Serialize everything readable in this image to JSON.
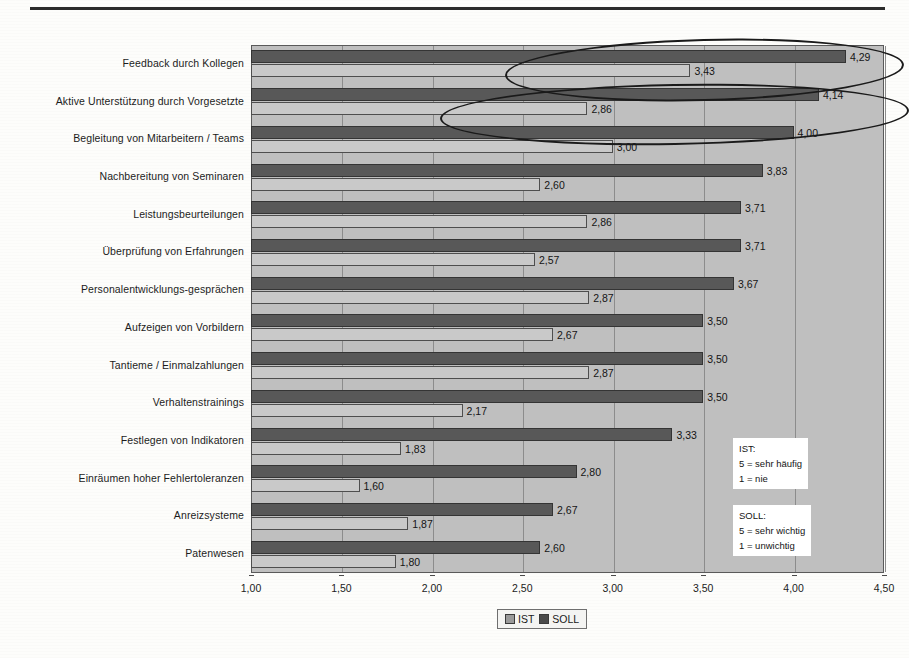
{
  "chart_data": {
    "type": "bar",
    "orientation": "horizontal",
    "title": "",
    "xlabel": "",
    "ylabel": "",
    "xlim": [
      1.0,
      4.5
    ],
    "xticks": [
      "1,00",
      "1,50",
      "2,00",
      "2,50",
      "3,00",
      "3,50",
      "4,00",
      "4,50"
    ],
    "xtick_values": [
      1.0,
      1.5,
      2.0,
      2.5,
      3.0,
      3.5,
      4.0,
      4.5
    ],
    "grid": true,
    "legend_position": "bottom-center",
    "categories": [
      "Feedback durch Kollegen",
      "Aktive Unterstützung durch Vorgesetzte",
      "Begleitung von Mitarbeitern / Teams",
      "Nachbereitung von Seminaren",
      "Leistungsbeurteilungen",
      "Überprüfung von Erfahrungen",
      "Personalentwicklungs-gesprächen",
      "Aufzeigen von Vorbildern",
      "Tantieme / Einmalzahlungen",
      "Verhaltenstrainings",
      "Festlegen von Indikatoren",
      "Einräumen hoher Fehlertoleranzen",
      "Anreizsysteme",
      "Patenwesen"
    ],
    "series": [
      {
        "name": "SOLL",
        "color": "#585858",
        "values": [
          4.29,
          4.14,
          4.0,
          3.83,
          3.71,
          3.71,
          3.67,
          3.5,
          3.5,
          3.5,
          3.33,
          2.8,
          2.67,
          2.6
        ],
        "labels": [
          "4,29",
          "4,14",
          "4,00",
          "3,83",
          "3,71",
          "3,71",
          "3,67",
          "3,50",
          "3,50",
          "3,50",
          "3,33",
          "2,80",
          "2,67",
          "2,60"
        ]
      },
      {
        "name": "IST",
        "color": "#c9c9c9",
        "values": [
          3.43,
          2.86,
          3.0,
          2.6,
          2.86,
          2.57,
          2.87,
          2.67,
          2.87,
          2.17,
          1.83,
          1.6,
          1.87,
          1.8
        ],
        "labels": [
          "3,43",
          "2,86",
          "3,00",
          "2,60",
          "2,86",
          "2,57",
          "2,87",
          "2,67",
          "2,87",
          "2,17",
          "1,83",
          "1,60",
          "1,87",
          "1,80"
        ]
      }
    ]
  },
  "legend": {
    "ist_label": "IST",
    "soll_label": "SOLL"
  },
  "notes": [
    {
      "title": "IST:",
      "line1": "5 = sehr häufig",
      "line2": "1 = nie"
    },
    {
      "title": "SOLL:",
      "line1": "5 = sehr wichtig",
      "line2": "1 = unwichtig"
    }
  ],
  "annotations": {
    "highlight_rows": [
      0,
      1
    ],
    "shape": "hand-drawn-ellipse",
    "color": "#1a1a1a"
  },
  "colors": {
    "plot_background": "#bfbfbf",
    "page_background": "#fdfdfb",
    "gridline": "#8c8c8c",
    "axis": "#5a5a5a"
  }
}
